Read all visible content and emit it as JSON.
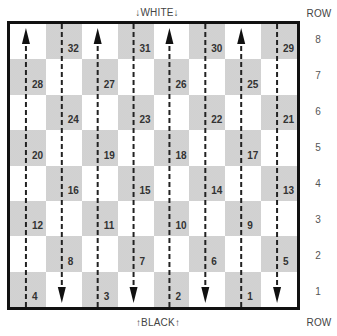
{
  "labels": {
    "top": "↓WHITE↓",
    "bottom": "↑BLACK↑",
    "row_header_top": "ROW",
    "row_header_bottom": "ROW"
  },
  "row_numbers": [
    "8",
    "7",
    "6",
    "5",
    "4",
    "3",
    "2",
    "1"
  ],
  "board": {
    "rows": 8,
    "cols": 8,
    "dark_color": "#e3e3e3",
    "border_color": "#111111",
    "squares": [
      {
        "num": "32",
        "row": 8,
        "col": 2
      },
      {
        "num": "31",
        "row": 8,
        "col": 4
      },
      {
        "num": "30",
        "row": 8,
        "col": 6
      },
      {
        "num": "29",
        "row": 8,
        "col": 8
      },
      {
        "num": "28",
        "row": 7,
        "col": 1
      },
      {
        "num": "27",
        "row": 7,
        "col": 3
      },
      {
        "num": "26",
        "row": 7,
        "col": 5
      },
      {
        "num": "25",
        "row": 7,
        "col": 7
      },
      {
        "num": "24",
        "row": 6,
        "col": 2
      },
      {
        "num": "23",
        "row": 6,
        "col": 4
      },
      {
        "num": "22",
        "row": 6,
        "col": 6
      },
      {
        "num": "21",
        "row": 6,
        "col": 8
      },
      {
        "num": "20",
        "row": 5,
        "col": 1
      },
      {
        "num": "19",
        "row": 5,
        "col": 3
      },
      {
        "num": "18",
        "row": 5,
        "col": 5
      },
      {
        "num": "17",
        "row": 5,
        "col": 7
      },
      {
        "num": "16",
        "row": 4,
        "col": 2
      },
      {
        "num": "15",
        "row": 4,
        "col": 4
      },
      {
        "num": "14",
        "row": 4,
        "col": 6
      },
      {
        "num": "13",
        "row": 4,
        "col": 8
      },
      {
        "num": "12",
        "row": 3,
        "col": 1
      },
      {
        "num": "11",
        "row": 3,
        "col": 3
      },
      {
        "num": "10",
        "row": 3,
        "col": 5
      },
      {
        "num": "9",
        "row": 3,
        "col": 7
      },
      {
        "num": "8",
        "row": 2,
        "col": 2
      },
      {
        "num": "7",
        "row": 2,
        "col": 4
      },
      {
        "num": "6",
        "row": 2,
        "col": 6
      },
      {
        "num": "5",
        "row": 2,
        "col": 8
      },
      {
        "num": "4",
        "row": 1,
        "col": 1
      },
      {
        "num": "3",
        "row": 1,
        "col": 3
      },
      {
        "num": "2",
        "row": 1,
        "col": 5
      },
      {
        "num": "1",
        "row": 1,
        "col": 7
      }
    ],
    "lanes": [
      {
        "col": 1,
        "direction": "up"
      },
      {
        "col": 2,
        "direction": "down"
      },
      {
        "col": 3,
        "direction": "up"
      },
      {
        "col": 4,
        "direction": "down"
      },
      {
        "col": 5,
        "direction": "up"
      },
      {
        "col": 6,
        "direction": "down"
      },
      {
        "col": 7,
        "direction": "up"
      },
      {
        "col": 8,
        "direction": "down"
      }
    ]
  }
}
